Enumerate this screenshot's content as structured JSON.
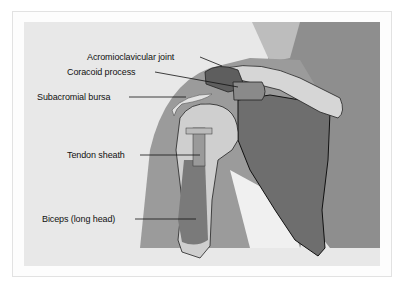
{
  "figure": {
    "type": "anatomical illustration",
    "labels": [
      {
        "id": "acromioclavicular-joint",
        "text": "Acromioclavicular joint"
      },
      {
        "id": "coracoid-process",
        "text": "Coracoid process"
      },
      {
        "id": "subacromial-bursa",
        "text": "Subacromial bursa"
      },
      {
        "id": "tendon-sheath",
        "text": "Tendon sheath"
      },
      {
        "id": "biceps-long-head",
        "text": "Biceps (long head)"
      }
    ]
  },
  "colors": {
    "page": "#ffffff",
    "frame_border": "#e2e2e2",
    "panel_bg": "#e8e8e8",
    "arm_skin": "#9b9b9b",
    "torso_skin": "#8c8c8c",
    "scapula": "#6e6e6e",
    "bone_light": "#d6d6d6",
    "biceps": "#7a7a7a"
  }
}
